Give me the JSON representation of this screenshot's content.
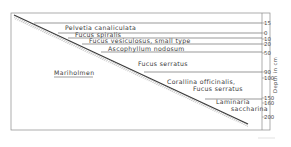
{
  "diagram": {
    "site": "Mariholmen",
    "axis": {
      "title": "Depth in cm",
      "ticks": [
        {
          "label": "15",
          "y": 23
        },
        {
          "label": "0",
          "y": 33
        },
        {
          "label": "10",
          "y": 39
        },
        {
          "label": "20",
          "y": 44
        },
        {
          "label": "50",
          "y": 53
        },
        {
          "label": "90",
          "y": 72
        },
        {
          "label": "100",
          "y": 78
        },
        {
          "label": "150",
          "y": 98
        },
        {
          "label": "160",
          "y": 103
        },
        {
          "label": "200",
          "y": 117
        }
      ]
    },
    "zones": [
      {
        "label": "Pelvetia canaliculata",
        "x": 65,
        "y": 30
      },
      {
        "label": "Fucus spiralis",
        "x": 75,
        "y": 37
      },
      {
        "label": "Fucus vesiculosus, small type",
        "x": 89,
        "y": 43
      },
      {
        "label": "Ascophyllum nodosum",
        "x": 108,
        "y": 51
      },
      {
        "label": "Fucus serratus",
        "x": 138,
        "y": 66
      },
      {
        "label": "Corallina officinalis,",
        "x": 167,
        "y": 84
      },
      {
        "label": "Fucus serratus",
        "x": 193,
        "y": 91
      },
      {
        "label": "Laminaria",
        "x": 216,
        "y": 104
      },
      {
        "label": "saccharina",
        "x": 231,
        "y": 111
      }
    ],
    "boundaries": [
      {
        "name": "boundary-15",
        "x1": 34,
        "y": 23
      },
      {
        "name": "boundary-0",
        "x1": 58,
        "y": 33
      },
      {
        "name": "boundary-10",
        "x1": 68,
        "y": 38
      },
      {
        "name": "boundary-20",
        "x1": 82,
        "y": 44
      },
      {
        "name": "boundary-50",
        "x1": 101,
        "y": 52
      },
      {
        "name": "boundary-90",
        "x1": 144,
        "y": 72
      },
      {
        "name": "boundary-150",
        "x1": 205,
        "y": 99
      }
    ],
    "colors": {
      "line": "#555555",
      "frame": "#888888",
      "hatch": "#666666"
    }
  }
}
